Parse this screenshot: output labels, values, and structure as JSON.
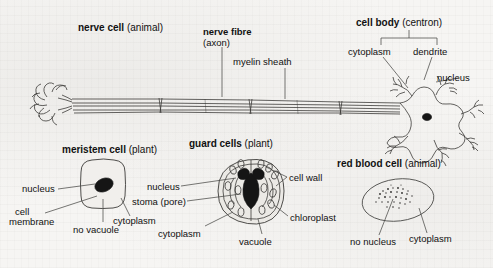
{
  "page": {
    "kind": "textbook-figure",
    "background_color": "#f6f5f3",
    "ink_color": "#3c3b39"
  },
  "figures": [
    {
      "id": "nerve-cell",
      "title_bold": "nerve cell",
      "title_regular": "(animal)",
      "labels": [
        {
          "name": "nerve-fibre",
          "bold": "nerve fibre",
          "regular": "(axon)"
        },
        {
          "name": "myelin-sheath",
          "text": "myelin sheath"
        }
      ]
    },
    {
      "id": "cell-body",
      "title_bold": "cell body",
      "title_regular": "(centron)",
      "labels": [
        {
          "name": "cytoplasm",
          "text": "cytoplasm"
        },
        {
          "name": "dendrite",
          "text": "dendrite"
        },
        {
          "name": "nucleus",
          "text": "nucleus"
        }
      ]
    },
    {
      "id": "meristem-cell",
      "title_bold": "meristem cell",
      "title_regular": "(plant)",
      "labels": [
        {
          "name": "nucleus",
          "text": "nucleus"
        },
        {
          "name": "cell-membrane-line1",
          "text": "cell"
        },
        {
          "name": "cell-membrane-line2",
          "text": "membrane"
        },
        {
          "name": "no-vacuole",
          "text": "no vacuole"
        },
        {
          "name": "cytoplasm",
          "text": "cytoplasm"
        }
      ]
    },
    {
      "id": "guard-cells",
      "title_bold": "guard cells",
      "title_regular": "(plant)",
      "labels": [
        {
          "name": "nucleus",
          "text": "nucleus"
        },
        {
          "name": "stoma-pore",
          "text": "stoma (pore)"
        },
        {
          "name": "cytoplasm",
          "text": "cytoplasm"
        },
        {
          "name": "cell-wall",
          "text": "cell wall"
        },
        {
          "name": "chloroplast",
          "text": "chloroplast"
        },
        {
          "name": "vacuole",
          "text": "vacuole"
        }
      ]
    },
    {
      "id": "red-blood-cell",
      "title_bold": "red blood cell",
      "title_regular": "(animal)",
      "labels": [
        {
          "name": "no-nucleus",
          "text": "no nucleus"
        },
        {
          "name": "cytoplasm",
          "text": "cytoplasm"
        }
      ]
    }
  ]
}
